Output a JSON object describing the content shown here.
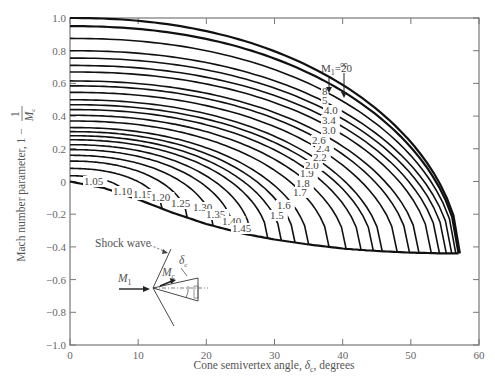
{
  "chart_data": {
    "type": "line",
    "title": "",
    "xlabel": "Cone semivertex angle, δc, degrees",
    "ylabel": "Mach number parameter, 1 − 1/Mc",
    "xlim": [
      0,
      60
    ],
    "ylim": [
      -1.0,
      1.0
    ],
    "x_ticks": [
      0,
      10,
      20,
      30,
      40,
      50,
      60
    ],
    "y_ticks": [
      1.0,
      0.8,
      0.6,
      0.4,
      0.2,
      0,
      -0.2,
      -0.4,
      -0.6,
      -0.8,
      -1.0
    ],
    "y_tick_labels": [
      "1.0",
      "0.8",
      "0.6",
      "0.4",
      "0.2",
      "0",
      "−0.2",
      "−0.4",
      "−0.6",
      "−0.8",
      "−1.0"
    ],
    "grid": false,
    "envelope": {
      "x": [
        0,
        5,
        10,
        15,
        20,
        25,
        30,
        35,
        40,
        45,
        50,
        55,
        57
      ],
      "y": [
        0,
        -0.04,
        -0.11,
        -0.19,
        -0.26,
        -0.315,
        -0.355,
        -0.385,
        -0.41,
        -0.425,
        -0.435,
        -0.44,
        -0.44
      ]
    },
    "series": [
      {
        "name": "1.05",
        "y0": 0.035,
        "x_end": 8.2
      },
      {
        "name": "1.10",
        "y0": 0.08,
        "x_end": 13.5
      },
      {
        "name": "1.15",
        "y0": 0.125,
        "x_end": 17.2
      },
      {
        "name": "1.20",
        "y0": 0.16,
        "x_end": 21.0
      },
      {
        "name": "1.25",
        "y0": 0.195,
        "x_end": 24.0
      },
      {
        "name": "1.30",
        "y0": 0.225,
        "x_end": 26.5
      },
      {
        "name": "1.35",
        "y0": 0.255,
        "x_end": 29.0
      },
      {
        "name": "1.40",
        "y0": 0.28,
        "x_end": 31.0
      },
      {
        "name": "1.45",
        "y0": 0.305,
        "x_end": 33.0
      },
      {
        "name": "1.5",
        "y0": 0.33,
        "x_end": 35.0
      },
      {
        "name": "1.6",
        "y0": 0.37,
        "x_end": 38.0
      },
      {
        "name": "1.7",
        "y0": 0.405,
        "x_end": 40.5
      },
      {
        "name": "1.8",
        "y0": 0.44,
        "x_end": 42.7
      },
      {
        "name": "1.9",
        "y0": 0.47,
        "x_end": 44.5
      },
      {
        "name": "2.0",
        "y0": 0.5,
        "x_end": 45.8
      },
      {
        "name": "2.2",
        "y0": 0.545,
        "x_end": 48.0
      },
      {
        "name": "2.4",
        "y0": 0.585,
        "x_end": 49.8
      },
      {
        "name": "2.6",
        "y0": 0.615,
        "x_end": 51.2
      },
      {
        "name": "3.0",
        "y0": 0.67,
        "x_end": 53.0
      },
      {
        "name": "3.4",
        "y0": 0.71,
        "x_end": 54.2
      },
      {
        "name": "4.0",
        "y0": 0.755,
        "x_end": 55.2
      },
      {
        "name": "5",
        "y0": 0.8,
        "x_end": 56.0
      },
      {
        "name": "8",
        "y0": 0.875,
        "x_end": 56.6
      },
      {
        "name": "M1=20",
        "y0": 0.95,
        "x_end": 57.0
      },
      {
        "name": "∞",
        "y0": 1.0,
        "x_end": 57.2
      }
    ],
    "annotations": {
      "inf_label": "∞",
      "m20_label": "M",
      "m20_sub": "1",
      "m20_value": "=20"
    },
    "inset": {
      "shock_label": "Shock wave",
      "m1_label": "M",
      "m1_sub": "1",
      "mc_label": "M",
      "mc_sub": "c",
      "delta_label": "δ",
      "delta_sub": "c"
    }
  },
  "axes": {
    "xlabel_main": "Cone semivertex angle, ",
    "xlabel_sym": "δ",
    "xlabel_sub": "c",
    "xlabel_tail": ", degrees",
    "ylabel_main": "Mach number parameter, 1 − ",
    "ylabel_frac_num": "1",
    "ylabel_frac_den": "M",
    "ylabel_frac_sub": "c"
  }
}
